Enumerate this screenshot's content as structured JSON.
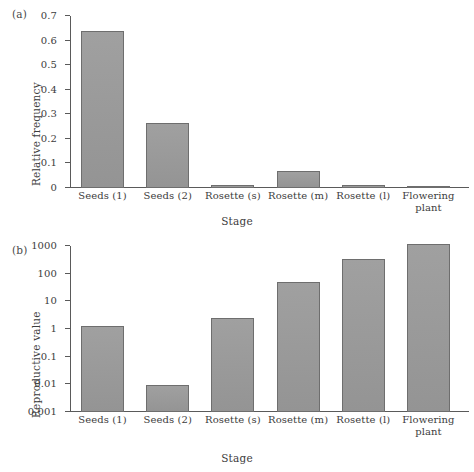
{
  "figure": {
    "panels": [
      {
        "tag": "(a)",
        "ylabel": "Relative frequency",
        "xlabel": "Stage"
      },
      {
        "tag": "(b)",
        "ylabel": "Reproductive value",
        "xlabel": "Stage"
      }
    ]
  },
  "colors": {
    "bar_fill": "#9a9a9a",
    "bar_stroke": "#6e6e6e",
    "axis": "#5a5a5a",
    "text": "#3c3c3c",
    "background": "#ffffff"
  },
  "chart_data": [
    {
      "type": "bar",
      "panel": "(a)",
      "title": "",
      "xlabel": "Stage",
      "ylabel": "Relative frequency",
      "categories": [
        "Seeds (1)",
        "Seeds (2)",
        "Rosette (s)",
        "Rosette (m)",
        "Rosette (l)",
        "Flowering plant"
      ],
      "values": [
        0.64,
        0.265,
        0.012,
        0.071,
        0.014,
        0.007
      ],
      "ylim": [
        0,
        0.7
      ],
      "yticks": [
        0,
        0.1,
        0.2,
        0.3,
        0.4,
        0.5,
        0.6,
        0.7
      ],
      "ytick_labels": [
        "0",
        "0.1",
        "0.2",
        "0.3",
        "0.4",
        "0.5",
        "0.6",
        "0.7"
      ],
      "yscale": "linear",
      "grid": false,
      "legend": "none"
    },
    {
      "type": "bar",
      "panel": "(b)",
      "title": "",
      "xlabel": "Stage",
      "ylabel": "Reproductive value",
      "categories": [
        "Seeds (1)",
        "Seeds (2)",
        "Rosette (s)",
        "Rosette (m)",
        "Rosette (l)",
        "Flowering plant"
      ],
      "values": [
        1.3,
        0.0097,
        2.6,
        52,
        350,
        1150
      ],
      "ylim": [
        0.001,
        1000
      ],
      "yticks": [
        0.001,
        0.01,
        0.1,
        1,
        10,
        100,
        1000
      ],
      "ytick_labels": [
        "0.001",
        "0.01",
        "0.1",
        "1",
        "10",
        "100",
        "1000"
      ],
      "yscale": "log",
      "grid": false,
      "legend": "none"
    }
  ]
}
